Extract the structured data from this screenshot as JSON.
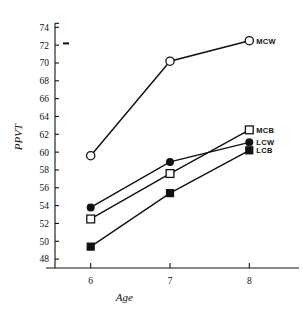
{
  "chart_data": {
    "type": "line",
    "title": "",
    "xlabel": "Age",
    "ylabel": "PPVT",
    "x": [
      6,
      7,
      8
    ],
    "xticklabels": [
      "6",
      "7",
      "8"
    ],
    "xlim": [
      5.55,
      8.45
    ],
    "ylim": [
      47.0,
      74.6
    ],
    "yticks": [
      48,
      50,
      52,
      54,
      56,
      58,
      60,
      62,
      64,
      66,
      68,
      70,
      72,
      74
    ],
    "yticklabels": [
      "48",
      "50",
      "52",
      "54",
      "56",
      "58",
      "60",
      "62",
      "64",
      "66",
      "68",
      "70",
      "72",
      "74"
    ],
    "grid": false,
    "legend_position": "right-inline-end-of-line",
    "series": [
      {
        "name": "MCW",
        "label": "MCW",
        "marker": "open-circle",
        "values": [
          59.6,
          70.2,
          72.5
        ]
      },
      {
        "name": "MCB",
        "label": "MCB",
        "marker": "open-square",
        "values": [
          52.5,
          57.6,
          62.5
        ]
      },
      {
        "name": "LCW",
        "label": "LCW",
        "marker": "filled-circle",
        "values": [
          53.8,
          58.9,
          61.1
        ]
      },
      {
        "name": "LCB",
        "label": "LCB",
        "marker": "filled-square",
        "values": [
          49.4,
          55.4,
          60.2
        ]
      }
    ],
    "annotations": [
      {
        "name": "axis-dash-mark",
        "y": 72.2,
        "text": "-"
      }
    ]
  },
  "colors": {
    "ink": "#111111",
    "background": "#ffffff"
  }
}
